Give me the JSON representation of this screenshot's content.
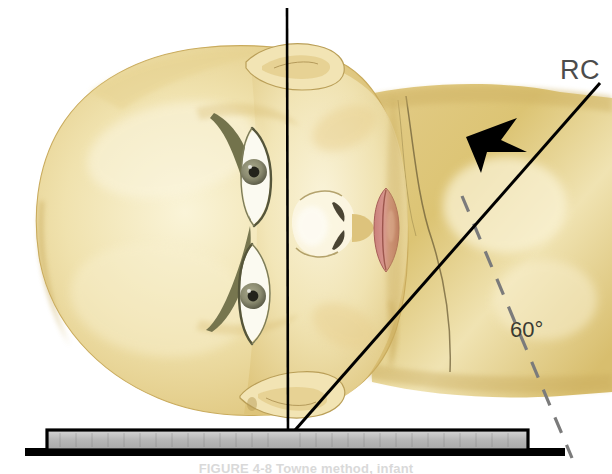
{
  "figure": {
    "background_color": "#ffffff",
    "labels": {
      "central_ray": "RC",
      "angle": "60°"
    },
    "caption": "FIGURE 4-8  Towne method, infant",
    "colors": {
      "skin_light": "#f4eccb",
      "skin_mid": "#e8d694",
      "skin_deep": "#d9bd6a",
      "shoulder": "#dcc474",
      "lip": "#d08a85",
      "lip_dark": "#b4655f",
      "eyebrow": "#6b6b45",
      "iris": "#8c8c72",
      "pupil": "#2b2b22",
      "line_black": "#000000",
      "dashed_gray": "#7b7b7b",
      "platform_gray": "#b9b9b9",
      "label_gray": "#4c4c4c"
    },
    "elements": {
      "vertical_line": {
        "name": "midsagittal-reference-line",
        "x": 287,
        "y_top": 8,
        "y_bottom": 437
      },
      "central_ray_arrow": {
        "name": "central-ray-arrow",
        "x_start": 598,
        "y_start": 88,
        "x_end": 288,
        "y_end": 437,
        "angle_deg": 60
      },
      "dashed_line": {
        "name": "perpendicular-dashed-reference-line",
        "x_start": 466,
        "y_start": 205,
        "x_end": 570,
        "y_end": 455
      },
      "platform": {
        "name": "image-receptor-platform",
        "x": 47,
        "y": 431,
        "width": 482,
        "height": 20
      },
      "table_edge": {
        "name": "table-edge-line",
        "x": 25,
        "y": 449,
        "width": 540,
        "height": 7
      }
    }
  }
}
